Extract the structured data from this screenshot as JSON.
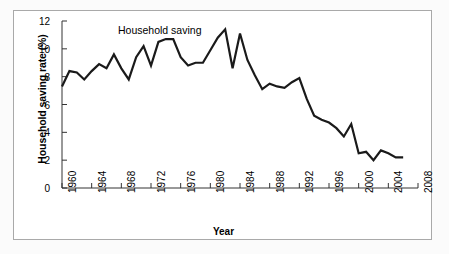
{
  "figure": {
    "background_color": "#ffffff",
    "frame_color": "#a9a9a9",
    "line_color": "#1a1a1a"
  },
  "chart_data": {
    "type": "line",
    "title": "",
    "annotation": "Household saving",
    "xlabel": "Year",
    "ylabel": "Household saving rate (%)",
    "xlim": [
      1960,
      2008
    ],
    "ylim": [
      0,
      12
    ],
    "grid": false,
    "legend_position": "inline-annotation",
    "yticks": [
      0,
      2,
      4,
      6,
      8,
      10,
      12
    ],
    "ytick_labels": [
      "0",
      "2",
      "4",
      "6",
      "8",
      "10",
      "12"
    ],
    "xticks": [
      1960,
      1964,
      1968,
      1972,
      1976,
      1980,
      1984,
      1988,
      1992,
      1996,
      2000,
      2004,
      2008
    ],
    "xtick_labels": [
      "1960",
      "1964",
      "1968",
      "1972",
      "1976",
      "1980",
      "1984",
      "1988",
      "1992",
      "1996",
      "2000",
      "2004",
      "2008"
    ],
    "series": [
      {
        "name": "Household saving",
        "x": [
          1960,
          1961,
          1962,
          1963,
          1964,
          1965,
          1966,
          1967,
          1968,
          1969,
          1970,
          1971,
          1972,
          1973,
          1974,
          1975,
          1976,
          1977,
          1978,
          1979,
          1980,
          1981,
          1982,
          1983,
          1984,
          1985,
          1986,
          1987,
          1988,
          1989,
          1990,
          1991,
          1992,
          1993,
          1994,
          1995,
          1996,
          1997,
          1998,
          1999,
          2000,
          2001,
          2002,
          2003,
          2004,
          2005,
          2006
        ],
        "values": [
          7.3,
          8.4,
          8.3,
          7.8,
          8.4,
          8.9,
          8.6,
          9.6,
          8.6,
          7.8,
          9.4,
          10.2,
          8.8,
          10.5,
          10.7,
          10.7,
          9.4,
          8.8,
          9.0,
          9.0,
          9.9,
          10.8,
          11.4,
          8.6,
          11.1,
          9.2,
          8.1,
          7.1,
          7.5,
          7.3,
          7.2,
          7.6,
          7.9,
          6.4,
          5.2,
          4.9,
          4.7,
          4.3,
          3.7,
          4.6,
          2.5,
          2.6,
          2.0,
          2.7,
          2.5,
          2.2,
          2.2
        ]
      }
    ]
  }
}
